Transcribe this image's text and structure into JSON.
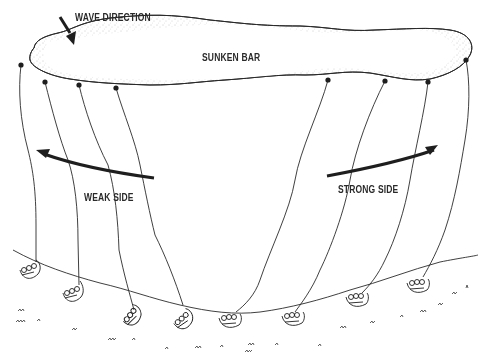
{
  "diagram": {
    "labels": {
      "wave_direction": "WAVE DIRECTION",
      "sunken_bar": "SUNKEN BAR",
      "weak_side": "WEAK SIDE",
      "strong_side": "STRONG SIDE"
    },
    "colors": {
      "ink": "#1e1e1e",
      "stipple": "#8a8a8a",
      "background": "#ffffff"
    },
    "anchors": [
      {
        "x": 21,
        "y": 65
      },
      {
        "x": 45,
        "y": 82
      },
      {
        "x": 79,
        "y": 85
      },
      {
        "x": 116,
        "y": 88
      },
      {
        "x": 328,
        "y": 80
      },
      {
        "x": 385,
        "y": 81
      },
      {
        "x": 428,
        "y": 82
      },
      {
        "x": 466,
        "y": 60
      }
    ],
    "swimmers": [
      {
        "x": 30,
        "y": 270
      },
      {
        "x": 72,
        "y": 293
      },
      {
        "x": 133,
        "y": 318
      },
      {
        "x": 185,
        "y": 320
      },
      {
        "x": 230,
        "y": 320
      },
      {
        "x": 292,
        "y": 318
      },
      {
        "x": 355,
        "y": 300
      },
      {
        "x": 417,
        "y": 285
      }
    ]
  }
}
